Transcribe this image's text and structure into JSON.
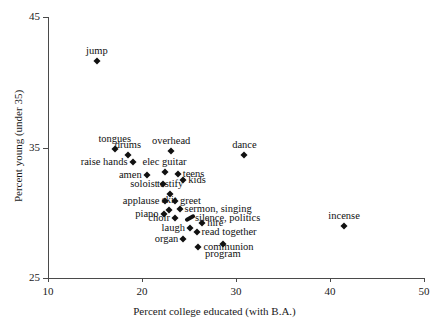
{
  "chart_data": {
    "type": "scatter",
    "title": "",
    "xlabel": "Percent college educated (with B.A.)",
    "ylabel": "Percent young (under 35)",
    "xlim": [
      10,
      50
    ],
    "ylim": [
      25,
      45
    ],
    "xticks": [
      10,
      20,
      30,
      40,
      50
    ],
    "yticks": [
      25,
      35,
      45
    ],
    "grid": false,
    "legend": "none",
    "points": [
      {
        "label": "jump",
        "x": 15.2,
        "y": 41.6,
        "lp": "above"
      },
      {
        "label": "tongues",
        "x": 17.1,
        "y": 34.9,
        "lp": "above"
      },
      {
        "label": "drums",
        "x": 18.5,
        "y": 34.4,
        "lp": "above"
      },
      {
        "label": "overhead",
        "x": 23.1,
        "y": 34.7,
        "lp": "above"
      },
      {
        "label": "raise hands",
        "x": 19.0,
        "y": 33.9,
        "lp": "left"
      },
      {
        "label": "elec guitar",
        "x": 22.4,
        "y": 33.1,
        "lp": "above"
      },
      {
        "label": "dance",
        "x": 30.9,
        "y": 34.4,
        "lp": "above"
      },
      {
        "label": "amen",
        "x": 20.5,
        "y": 32.9,
        "lp": "left"
      },
      {
        "label": "teens",
        "x": 23.8,
        "y": 33.0,
        "lp": "right"
      },
      {
        "label": "kids",
        "x": 24.4,
        "y": 32.5,
        "lp": "right"
      },
      {
        "label": "soloist",
        "x": 22.2,
        "y": 32.2,
        "lp": "left"
      },
      {
        "label": "testify",
        "x": 23.0,
        "y": 31.4,
        "lp": "above"
      },
      {
        "label": "applause",
        "x": 22.4,
        "y": 30.9,
        "lp": "left"
      },
      {
        "label": "greet",
        "x": 23.5,
        "y": 30.9,
        "lp": "right"
      },
      {
        "label": "sermon, singing",
        "x": 24.0,
        "y": 30.3,
        "lp": "right"
      },
      {
        "label": "skit",
        "x": 22.9,
        "y": 30.2,
        "lp": "above"
      },
      {
        "label": "piano",
        "x": 22.3,
        "y": 29.9,
        "lp": "left"
      },
      {
        "label": "choir",
        "x": 23.5,
        "y": 29.6,
        "lp": "left"
      },
      {
        "label": "silence, politics",
        "x": 25.1,
        "y": 29.6,
        "lp": "right",
        "wide": true
      },
      {
        "label": "hire",
        "x": 26.4,
        "y": 29.2,
        "lp": "right"
      },
      {
        "label": "laugh",
        "x": 25.1,
        "y": 28.8,
        "lp": "left"
      },
      {
        "label": "read together",
        "x": 25.8,
        "y": 28.5,
        "lp": "right"
      },
      {
        "label": "organ",
        "x": 24.4,
        "y": 28.0,
        "lp": "left"
      },
      {
        "label": "communion",
        "x": 26.0,
        "y": 27.4,
        "lp": "right"
      },
      {
        "label": "program",
        "x": 28.6,
        "y": 27.6,
        "lp": "below"
      },
      {
        "label": "incense",
        "x": 41.5,
        "y": 29.0,
        "lp": "above"
      }
    ]
  }
}
